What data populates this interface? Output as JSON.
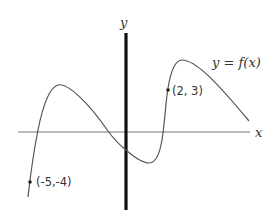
{
  "diagram": {
    "type": "function-graph",
    "axes": {
      "x_label": "x",
      "y_label": "y"
    },
    "curve": {
      "label": "y = f(x)",
      "label_parts": {
        "y": "y",
        "eq": "=",
        "fx": "f(x)"
      },
      "color": "#555555"
    },
    "points": [
      {
        "label": "(2, 3)",
        "x": 2,
        "y": 3
      },
      {
        "label": "(-5,-4)",
        "x": -5,
        "y": -4
      }
    ],
    "colors": {
      "axis_x": "#777777",
      "axis_y": "#111111",
      "text": "#333333"
    }
  }
}
